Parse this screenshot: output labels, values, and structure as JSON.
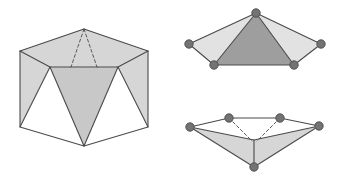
{
  "page": {
    "background_color": "#ffffff",
    "width": 341,
    "height": 182
  },
  "style": {
    "edge_color": "#4a4a4a",
    "edge_width": 1.1,
    "hidden_edge_color": "#5a5a5a",
    "hidden_edge_width": 1.0,
    "hidden_edge_dash": "3,2.4",
    "fill_light": "#d6d6d6",
    "fill_lighter": "#e2e2e2",
    "fill_mid": "#c8c8c8",
    "fill_dark": "#9e9e9e",
    "fill_white": "#ffffff",
    "vertex_fill": "#737373",
    "vertex_stroke": "#4a4a4a",
    "vertex_radius": 4.2
  },
  "figures": [
    {
      "id": "left-antiprism",
      "name": "gyroelongated-solid",
      "description": "Three-dimensional solid with hexagonal top rim and zigzag band of triangles",
      "vertices": {
        "top_apex": [
          84,
          29
        ],
        "top_left": [
          20,
          51
        ],
        "top_right": [
          148,
          51
        ],
        "rim_left": [
          20,
          51
        ],
        "rim_mid_left": [
          50,
          67
        ],
        "rim_mid_right": [
          118,
          67
        ],
        "rim_right": [
          148,
          51
        ],
        "bottom_left": [
          20,
          127
        ],
        "bottom_apex": [
          84,
          146
        ],
        "bottom_right": [
          148,
          127
        ]
      },
      "faces": [
        {
          "name": "top-left-facet",
          "points": "20,51 84,29 84,67 50,67",
          "fill": "#d6d6d6"
        },
        {
          "name": "top-right-facet",
          "points": "148,51 84,29 84,67 118,67",
          "fill": "#d6d6d6"
        },
        {
          "name": "side-left-panel",
          "points": "20,51 50,67 20,127",
          "fill": "#d6d6d6"
        },
        {
          "name": "side-right-panel",
          "points": "148,51 118,67 148,127",
          "fill": "#d6d6d6"
        },
        {
          "name": "band-left-triangle-up",
          "points": "20,51 50,67 20,127",
          "fill": "#d6d6d6"
        },
        {
          "name": "band-center-triangle",
          "points": "50,67 118,67 84,146",
          "fill": "#c8c8c8"
        },
        {
          "name": "band-left-white",
          "points": "20,127 50,67 84,146",
          "fill": "#ffffff"
        },
        {
          "name": "band-right-white",
          "points": "148,127 118,67 84,146",
          "fill": "#ffffff"
        }
      ],
      "solid_edges": [
        "20,51 84,29 148,51",
        "20,51 20,127 84,146 148,127 148,51",
        "20,51 50,67 118,67 148,51",
        "50,67 20,127",
        "118,67 148,127",
        "50,67 84,146",
        "118,67 84,146"
      ],
      "hidden_edges": [
        "84,29 71,67",
        "84,29 97,67"
      ]
    },
    {
      "id": "top-right-fan",
      "name": "pyramid-net-upper",
      "description": "Flattened pyramid net seen from above with five marked vertices",
      "vertices": [
        {
          "name": "apex",
          "x": 256,
          "y": 13
        },
        {
          "name": "left-outer",
          "x": 189,
          "y": 44
        },
        {
          "name": "right-outer",
          "x": 321,
          "y": 44
        },
        {
          "name": "base-left",
          "x": 214,
          "y": 65
        },
        {
          "name": "base-right",
          "x": 294,
          "y": 65
        }
      ],
      "faces": [
        {
          "name": "left-wing",
          "points": "256,13 189,44 214,65",
          "fill": "#e2e2e2"
        },
        {
          "name": "right-wing",
          "points": "256,13 321,44 294,65",
          "fill": "#e2e2e2"
        },
        {
          "name": "center-face",
          "points": "256,13 214,65 294,65",
          "fill": "#9e9e9e"
        }
      ],
      "solid_edges": [
        "256,13 189,44 214,65 294,65 321,44 256,13",
        "256,13 214,65",
        "256,13 294,65"
      ],
      "hidden_edges": []
    },
    {
      "id": "bottom-right-fan",
      "name": "pyramid-net-lower",
      "description": "Flattened pyramid net seen from below with five marked vertices and dashed hidden edges",
      "vertices": [
        {
          "name": "left-outer",
          "x": 190,
          "y": 127
        },
        {
          "name": "top-left",
          "x": 229,
          "y": 118
        },
        {
          "name": "top-right",
          "x": 280,
          "y": 118
        },
        {
          "name": "right-outer",
          "x": 319,
          "y": 126
        },
        {
          "name": "bottom-apex",
          "x": 254,
          "y": 167
        }
      ],
      "faces": [
        {
          "name": "left-wing",
          "points": "190,127 229,118 254,140",
          "fill": "#ffffff"
        },
        {
          "name": "right-wing",
          "points": "319,126 280,118 254,140",
          "fill": "#ffffff"
        },
        {
          "name": "lower-left-face",
          "points": "190,127 254,140 254,167",
          "fill": "#d6d6d6"
        },
        {
          "name": "lower-right-face",
          "points": "319,126 254,140 254,167",
          "fill": "#d6d6d6"
        },
        {
          "name": "top-strip",
          "points": "229,118 280,118 254,140",
          "fill": "#ffffff"
        }
      ],
      "solid_edges": [
        "190,127 229,118 280,118 319,126",
        "190,127 254,140 319,126",
        "190,127 254,167 319,126",
        "254,140 254,167"
      ],
      "hidden_edges": [
        "229,118 252,141",
        "280,118 257,141"
      ]
    }
  ]
}
